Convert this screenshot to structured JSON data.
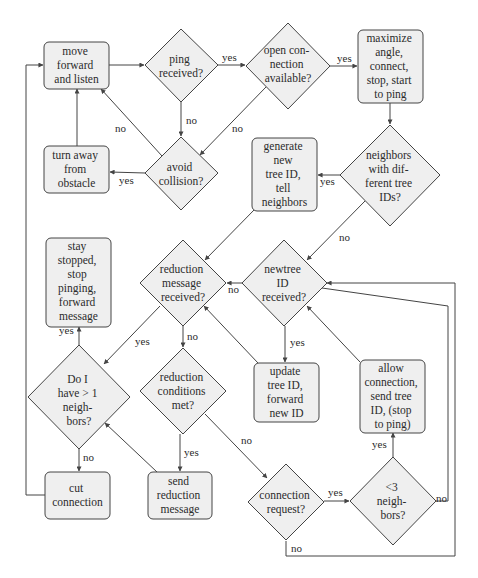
{
  "colors": {
    "node_fill": "#efefef",
    "stroke": "#444444",
    "text": "#2b2b2b",
    "background": "#ffffff"
  },
  "nodes": {
    "move_forward": {
      "type": "process",
      "lines": [
        "move",
        "forward",
        "and listen"
      ]
    },
    "ping_received": {
      "type": "decision",
      "lines": [
        "ping",
        "received?"
      ]
    },
    "open_connection": {
      "type": "decision",
      "lines": [
        "open con-",
        "nection",
        "available?"
      ]
    },
    "maximize_angle": {
      "type": "process",
      "lines": [
        "maximize",
        "angle,",
        "connect,",
        "stop, start",
        "to ping"
      ]
    },
    "avoid_collision": {
      "type": "decision",
      "lines": [
        "avoid",
        "collision?"
      ]
    },
    "turn_away": {
      "type": "process",
      "lines": [
        "turn away",
        "from",
        "obstacle"
      ]
    },
    "neighbors_diff": {
      "type": "decision",
      "lines": [
        "neighbors",
        "with dif-",
        "ferent tree",
        "IDs?"
      ]
    },
    "generate_tree": {
      "type": "process",
      "lines": [
        "generate",
        "new",
        "tree ID,",
        "tell",
        "neighbors"
      ]
    },
    "reduction_received": {
      "type": "decision",
      "lines": [
        "reduction",
        "message",
        "received?"
      ]
    },
    "newtree_received": {
      "type": "decision",
      "lines": [
        "newtree",
        "ID",
        "received?"
      ]
    },
    "stay_stopped": {
      "type": "process",
      "lines": [
        "stay",
        "stopped,",
        "stop",
        "pinging,",
        "forward",
        "message"
      ]
    },
    "more_neighbors": {
      "type": "decision",
      "lines": [
        "Do I",
        "have > 1",
        "neigh-",
        "bors?"
      ]
    },
    "reduction_conditions": {
      "type": "decision",
      "lines": [
        "reduction",
        "conditions",
        "met?"
      ]
    },
    "update_tree": {
      "type": "process",
      "lines": [
        "update",
        "tree ID,",
        "forward",
        "new ID"
      ]
    },
    "allow_connection": {
      "type": "process",
      "lines": [
        "allow",
        "connection,",
        "send tree",
        "ID, (stop",
        "to ping)"
      ]
    },
    "cut_connection": {
      "type": "process",
      "lines": [
        "cut",
        "connection"
      ]
    },
    "send_reduction": {
      "type": "process",
      "lines": [
        "send",
        "reduction",
        "message"
      ]
    },
    "connection_request": {
      "type": "decision",
      "lines": [
        "connection",
        "request?"
      ]
    },
    "less_three": {
      "type": "decision",
      "lines": [
        "<3",
        "neigh-",
        "bors?"
      ]
    }
  },
  "edge_labels": {
    "ping_yes": "yes",
    "ping_no": "no",
    "open_yes": "yes",
    "open_no": "no",
    "avoid_yes": "yes",
    "avoid_no": "no",
    "neighbors_yes": "yes",
    "neighbors_no": "no",
    "newtree_no": "no",
    "newtree_yes": "yes",
    "reduction_yes": "yes",
    "reduction_no": "no",
    "more_yes": "yes",
    "more_no": "no",
    "conditions_yes": "yes",
    "conditions_no": "no",
    "request_yes": "yes",
    "request_no": "no",
    "three_yes": "yes",
    "three_no": "no"
  }
}
